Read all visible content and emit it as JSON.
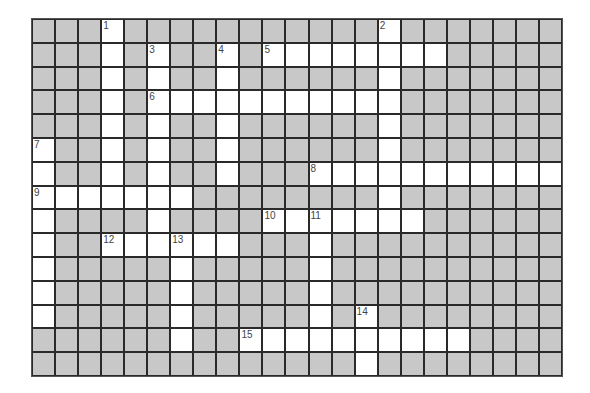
{
  "puzzle": {
    "cols": 23,
    "rows": 15,
    "colors": {
      "block": "#c8c8c8",
      "open": "#ffffff",
      "grid_line": "#2a2a2a",
      "number": "#444444"
    },
    "open_cells": [
      [
        0,
        [
          3,
          15
        ]
      ],
      [
        1,
        [
          3,
          5,
          8,
          10,
          11,
          12,
          13,
          14,
          15,
          16,
          17
        ]
      ],
      [
        2,
        [
          3,
          5,
          8,
          15
        ]
      ],
      [
        3,
        [
          3,
          5,
          6,
          7,
          8,
          9,
          10,
          11,
          12,
          13,
          14,
          15
        ]
      ],
      [
        4,
        [
          3,
          5,
          8,
          15
        ]
      ],
      [
        5,
        [
          0,
          3,
          5,
          8,
          15
        ]
      ],
      [
        6,
        [
          0,
          3,
          5,
          8,
          12,
          13,
          14,
          15,
          16,
          17,
          18,
          19,
          20,
          21,
          22
        ]
      ],
      [
        7,
        [
          0,
          1,
          2,
          3,
          4,
          5,
          6,
          15
        ]
      ],
      [
        8,
        [
          0,
          5,
          10,
          11,
          12,
          13,
          14,
          15,
          16
        ]
      ],
      [
        9,
        [
          0,
          3,
          4,
          5,
          6,
          7,
          8,
          12
        ]
      ],
      [
        10,
        [
          0,
          6,
          12
        ]
      ],
      [
        11,
        [
          0,
          6,
          12
        ]
      ],
      [
        12,
        [
          0,
          6,
          12,
          14
        ]
      ],
      [
        13,
        [
          6,
          9,
          10,
          11,
          12,
          13,
          14,
          15,
          16,
          17,
          18
        ]
      ],
      [
        14,
        [
          14
        ]
      ]
    ],
    "clue_numbers": [
      {
        "label": "1",
        "row": 0,
        "col": 3
      },
      {
        "label": "2",
        "row": 0,
        "col": 15
      },
      {
        "label": "3",
        "row": 1,
        "col": 5
      },
      {
        "label": "4",
        "row": 1,
        "col": 8
      },
      {
        "label": "5",
        "row": 1,
        "col": 10
      },
      {
        "label": "6",
        "row": 3,
        "col": 5
      },
      {
        "label": "7",
        "row": 5,
        "col": 0
      },
      {
        "label": "8",
        "row": 6,
        "col": 12
      },
      {
        "label": "9",
        "row": 7,
        "col": 0
      },
      {
        "label": "10",
        "row": 8,
        "col": 10
      },
      {
        "label": "11",
        "row": 8,
        "col": 12
      },
      {
        "label": "12",
        "row": 9,
        "col": 3
      },
      {
        "label": "13",
        "row": 9,
        "col": 6
      },
      {
        "label": "14",
        "row": 12,
        "col": 14
      },
      {
        "label": "15",
        "row": 13,
        "col": 9
      }
    ],
    "entries": {
      "across": [
        {
          "label": "5",
          "row": 1,
          "col": 10,
          "length": 8
        },
        {
          "label": "6",
          "row": 3,
          "col": 5,
          "length": 11
        },
        {
          "label": "8",
          "row": 6,
          "col": 12,
          "length": 11
        },
        {
          "label": "9",
          "row": 7,
          "col": 0,
          "length": 7
        },
        {
          "label": "10",
          "row": 8,
          "col": 10,
          "length": 7
        },
        {
          "label": "12",
          "row": 9,
          "col": 3,
          "length": 6
        },
        {
          "label": "15",
          "row": 13,
          "col": 9,
          "length": 10
        }
      ],
      "down": [
        {
          "label": "1",
          "row": 0,
          "col": 3,
          "length": 8
        },
        {
          "label": "2",
          "row": 0,
          "col": 15,
          "length": 9
        },
        {
          "label": "3",
          "row": 1,
          "col": 5,
          "length": 9
        },
        {
          "label": "4",
          "row": 1,
          "col": 8,
          "length": 6
        },
        {
          "label": "7",
          "row": 5,
          "col": 0,
          "length": 8
        },
        {
          "label": "11",
          "row": 8,
          "col": 12,
          "length": 6
        },
        {
          "label": "13",
          "row": 9,
          "col": 6,
          "length": 5
        },
        {
          "label": "14",
          "row": 12,
          "col": 14,
          "length": 3
        }
      ]
    }
  }
}
